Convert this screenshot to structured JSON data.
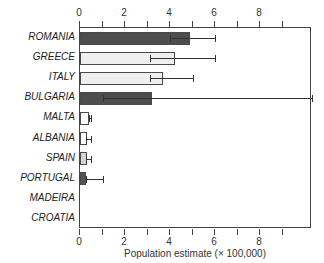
{
  "chart_data": {
    "type": "bar",
    "orientation": "horizontal",
    "title": "",
    "xlabel": "Population estimate (× 100,000)",
    "ylabel": "",
    "xlim": [
      0,
      10.3
    ],
    "xticks": [
      0,
      2,
      4,
      6,
      8
    ],
    "xticklabels": [
      "0",
      "2",
      "4",
      "6",
      "8"
    ],
    "minor_ticks": [
      1,
      3,
      5,
      7,
      9
    ],
    "axis_top": true,
    "axis_bottom": true,
    "grid": false,
    "legend": null,
    "categories": [
      "ROMANIA",
      "GREECE",
      "ITALY",
      "BULGARIA",
      "MALTA",
      "ALBANIA",
      "SPAIN",
      "PORTUGAL",
      "MADEIRA",
      "CROATIA"
    ],
    "values": [
      4.9,
      4.2,
      3.7,
      3.2,
      0.4,
      0.3,
      0.3,
      0.25,
      0.0,
      0.0
    ],
    "error_low": [
      4.0,
      3.1,
      3.1,
      1.0,
      0.4,
      0.25,
      0.25,
      0.25,
      0.0,
      0.0
    ],
    "error_high": [
      6.0,
      6.0,
      5.0,
      10.3,
      0.5,
      0.5,
      0.5,
      1.0,
      0.0,
      0.0
    ],
    "bar_colors": [
      "#4d4d4d",
      "#efefef",
      "#efefef",
      "#4d4d4d",
      "#fbfbfb",
      "#ffffff",
      "#d4d4d4",
      "#555555",
      "#ffffff",
      "#ffffff"
    ],
    "bar_edge_color": "#4a4a4a",
    "error_color": "#333333",
    "axis_color": "#444444",
    "background": "#ffffff",
    "bars": [
      {
        "category": "ROMANIA",
        "value": 4.9,
        "err_low": 4.0,
        "err_high": 6.0,
        "color": "#4d4d4d"
      },
      {
        "category": "GREECE",
        "value": 4.2,
        "err_low": 3.1,
        "err_high": 6.0,
        "color": "#efefef"
      },
      {
        "category": "ITALY",
        "value": 3.7,
        "err_low": 3.1,
        "err_high": 5.0,
        "color": "#efefef"
      },
      {
        "category": "BULGARIA",
        "value": 3.2,
        "err_low": 1.0,
        "err_high": 10.3,
        "color": "#4d4d4d"
      },
      {
        "category": "MALTA",
        "value": 0.4,
        "err_low": 0.4,
        "err_high": 0.5,
        "color": "#fbfbfb"
      },
      {
        "category": "ALBANIA",
        "value": 0.3,
        "err_low": 0.25,
        "err_high": 0.5,
        "color": "#ffffff"
      },
      {
        "category": "SPAIN",
        "value": 0.3,
        "err_low": 0.25,
        "err_high": 0.5,
        "color": "#d4d4d4"
      },
      {
        "category": "PORTUGAL",
        "value": 0.25,
        "err_low": 0.25,
        "err_high": 1.0,
        "color": "#555555"
      },
      {
        "category": "MADEIRA",
        "value": 0.0,
        "err_low": 0.0,
        "err_high": 0.0,
        "color": "#ffffff"
      },
      {
        "category": "CROATIA",
        "value": 0.0,
        "err_low": 0.0,
        "err_high": 0.0,
        "color": "#ffffff"
      }
    ]
  }
}
